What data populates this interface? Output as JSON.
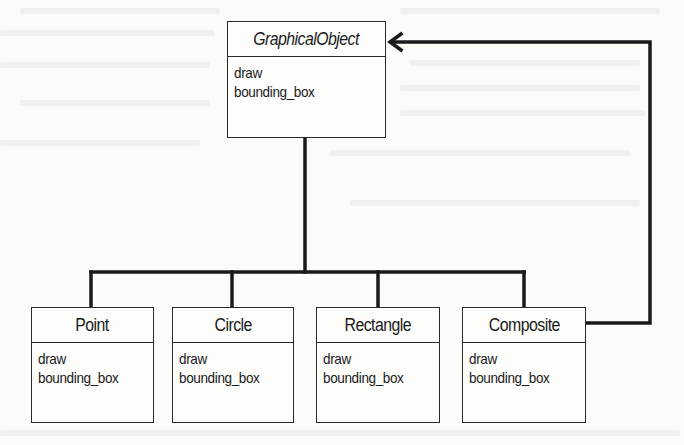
{
  "diagram": {
    "type": "uml-class-hierarchy",
    "pattern": "Composite",
    "parent": {
      "name": "GraphicalObject",
      "abstract": true,
      "operations": [
        "draw",
        "bounding_box"
      ]
    },
    "children": [
      {
        "name": "Point",
        "operations": [
          "draw",
          "bounding_box"
        ]
      },
      {
        "name": "Circle",
        "operations": [
          "draw",
          "bounding_box"
        ]
      },
      {
        "name": "Rectangle",
        "operations": [
          "draw",
          "bounding_box"
        ]
      },
      {
        "name": "Composite",
        "operations": [
          "draw",
          "bounding_box"
        ]
      }
    ],
    "relations": [
      {
        "from": "Point",
        "to": "GraphicalObject",
        "kind": "inheritance"
      },
      {
        "from": "Circle",
        "to": "GraphicalObject",
        "kind": "inheritance"
      },
      {
        "from": "Rectangle",
        "to": "GraphicalObject",
        "kind": "inheritance"
      },
      {
        "from": "Composite",
        "to": "GraphicalObject",
        "kind": "inheritance"
      },
      {
        "from": "Composite",
        "to": "GraphicalObject",
        "kind": "association-arrow"
      }
    ],
    "colors": {
      "line": "#1a1a1a",
      "background": "#fbfbf8"
    }
  }
}
